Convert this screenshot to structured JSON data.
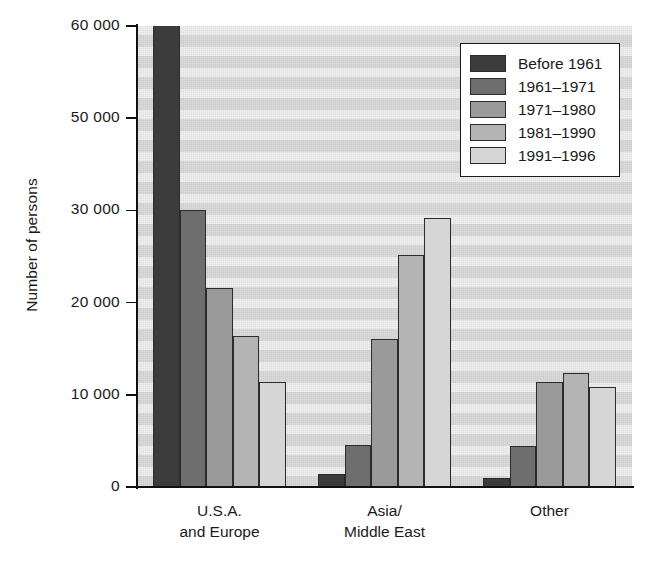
{
  "chart_data": {
    "type": "bar",
    "title": "",
    "subtitle": "",
    "xlabel": "",
    "ylabel": "Number of persons",
    "categories": [
      "U.S.A. and Europe",
      "Asia/Middle East",
      "Other"
    ],
    "category_lines": [
      [
        "U.S.A.",
        "and Europe"
      ],
      [
        "Asia/",
        "Middle East"
      ],
      [
        "Other"
      ]
    ],
    "series": [
      {
        "name": "Before 1961",
        "color": "#3c3c3c",
        "values": [
          61000,
          1400,
          1000
        ]
      },
      {
        "name": "1961–1971",
        "color": "#6e6e6e",
        "values": [
          30000,
          4600,
          4500
        ]
      },
      {
        "name": "1971–1980",
        "color": "#9a9a9a",
        "values": [
          21600,
          16000,
          11400
        ]
      },
      {
        "name": "1981–1990",
        "color": "#b4b4b4",
        "values": [
          16400,
          25200,
          12400
        ]
      },
      {
        "name": "1991–1996",
        "color": "#d6d6d6",
        "values": [
          11400,
          29200,
          10900
        ]
      }
    ],
    "ylim": [
      0,
      50000
    ],
    "ytick_values": [
      0,
      10000,
      20000,
      30000,
      40000,
      50000
    ],
    "ytick_labels": [
      "0",
      "10 000",
      "20 000",
      "30 000",
      "50 000",
      "60 000"
    ],
    "grid": false,
    "banded_background": true,
    "legend_position": "top-right",
    "plot_background_color": "#e2e2e2",
    "axis_color": "#111111"
  },
  "legend": {
    "entries": [
      {
        "label": "Before 1961"
      },
      {
        "label": "1961–1971"
      },
      {
        "label": "1971–1980"
      },
      {
        "label": "1981–1990"
      },
      {
        "label": "1991–1996"
      }
    ]
  }
}
